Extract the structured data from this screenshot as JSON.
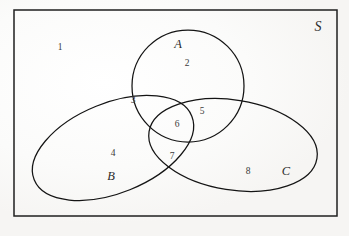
{
  "figure": {
    "type": "venn-diagram",
    "sets": 3,
    "background_color": "#fdfdfc",
    "stroke_color": "#1a1a1a",
    "text_color": "#2b2b2b"
  },
  "universe": {
    "label": "S",
    "shape": "rectangle",
    "bounds": {
      "x": 14,
      "y": 10,
      "width": 323,
      "height": 206
    },
    "label_position": {
      "x": 318,
      "y": 27
    }
  },
  "sets": [
    {
      "name": "A",
      "label": "A",
      "shape": "circle",
      "cx": 188,
      "cy": 86,
      "rx": 56,
      "ry": 56,
      "rotation": 0,
      "label_position": {
        "x": 178,
        "y": 44
      }
    },
    {
      "name": "B",
      "label": "B",
      "shape": "ellipse",
      "cx": 113,
      "cy": 148,
      "rx": 85,
      "ry": 45,
      "rotation": -22,
      "label_position": {
        "x": 111,
        "y": 176
      }
    },
    {
      "name": "C",
      "label": "C",
      "shape": "ellipse",
      "cx": 233,
      "cy": 145,
      "rx": 85,
      "ry": 45,
      "rotation": 9,
      "label_position": {
        "x": 286,
        "y": 171
      }
    }
  ],
  "regions": [
    {
      "id": "region-1",
      "number": "1",
      "description": "outside-all-sets",
      "x": 60,
      "y": 48
    },
    {
      "id": "region-2",
      "number": "2",
      "description": "A-only",
      "x": 187,
      "y": 64
    },
    {
      "id": "region-3",
      "number": "3",
      "description": "A-and-B-only",
      "x": 133,
      "y": 101
    },
    {
      "id": "region-4",
      "number": "4",
      "description": "B-only",
      "x": 113,
      "y": 154
    },
    {
      "id": "region-5",
      "number": "5",
      "description": "A-and-C-only",
      "x": 202,
      "y": 112
    },
    {
      "id": "region-6",
      "number": "6",
      "description": "A-and-B-and-C",
      "x": 177,
      "y": 125
    },
    {
      "id": "region-7",
      "number": "7",
      "description": "B-and-C-only",
      "x": 172,
      "y": 157
    },
    {
      "id": "region-8",
      "number": "8",
      "description": "C-only",
      "x": 248,
      "y": 172
    }
  ]
}
